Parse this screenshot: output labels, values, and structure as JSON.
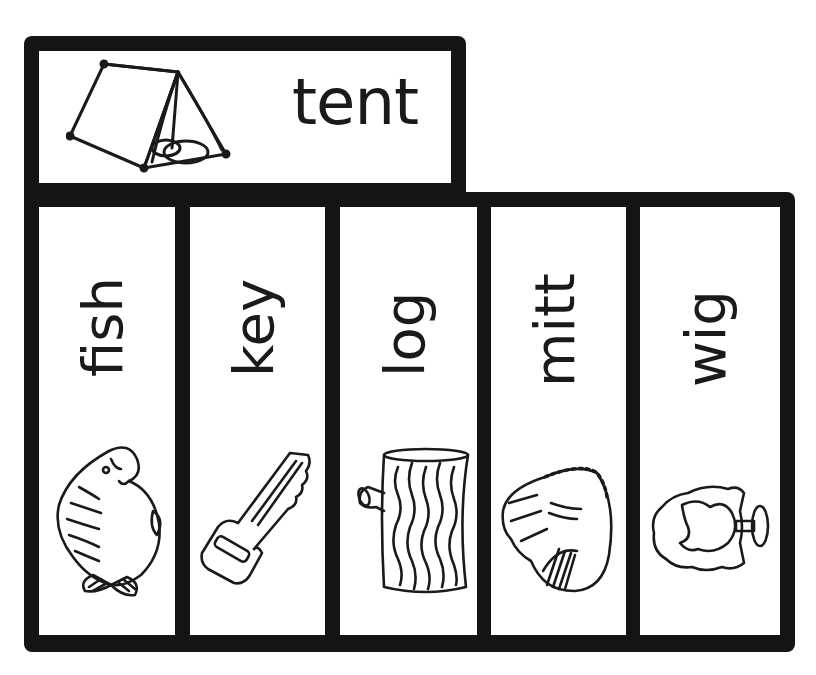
{
  "worksheet": {
    "header_card": {
      "word": "tent",
      "picture": "tent-icon"
    },
    "word_cards": [
      {
        "word": "fish",
        "picture": "fish-icon"
      },
      {
        "word": "key",
        "picture": "key-icon"
      },
      {
        "word": "log",
        "picture": "log-icon"
      },
      {
        "word": "mitt",
        "picture": "mitt-icon"
      },
      {
        "word": "wig",
        "picture": "wig-icon"
      }
    ],
    "colors": {
      "frame": "#141414",
      "card": "#ffffff",
      "ink": "#1a1a1a"
    }
  }
}
